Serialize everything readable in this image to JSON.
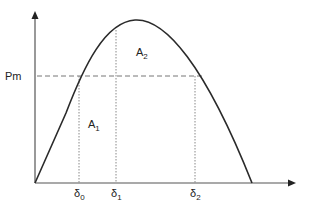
{
  "diagram": {
    "type": "power-angle-curve",
    "y_axis_label": "Pm",
    "areas": [
      {
        "symbol": "A",
        "subscript": "1"
      },
      {
        "symbol": "A",
        "subscript": "2"
      }
    ],
    "angles": [
      {
        "symbol": "δ",
        "subscript": "0"
      },
      {
        "symbol": "δ",
        "subscript": "1"
      },
      {
        "symbol": "δ",
        "subscript": "2"
      }
    ],
    "colors": {
      "curve": "#2a2a2a",
      "axis": "#555555",
      "dashed": "#777777",
      "text": "#222222"
    }
  }
}
